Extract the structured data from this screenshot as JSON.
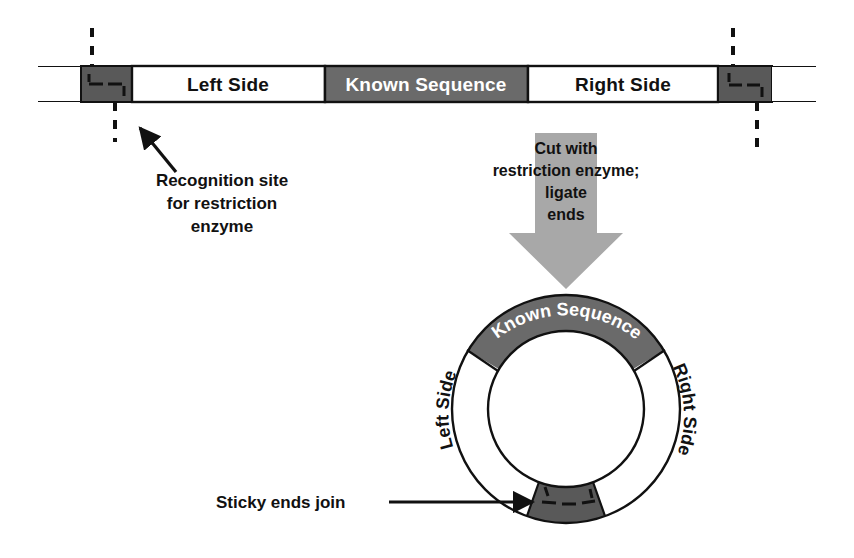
{
  "figure": {
    "colors": {
      "background": "#ffffff",
      "outline": "#111111",
      "known_sequence_gray": "#6a6a6a",
      "recognition_site_gray": "#595959",
      "arrow_gray": "#a8a8a8",
      "text_dark": "#111111",
      "text_light": "#ffffff"
    }
  },
  "linear_molecule": {
    "name": "linear-dna-bar",
    "segments": [
      {
        "id": "flank-left",
        "label": "",
        "fill": "#ffffff",
        "text_color": "dark"
      },
      {
        "id": "recognition-left",
        "label": "",
        "fill": "#595959",
        "text_color": "light"
      },
      {
        "id": "left-side",
        "label": "Left Side",
        "fill": "#ffffff",
        "text_color": "dark"
      },
      {
        "id": "known-sequence",
        "label": "Known Sequence",
        "fill": "#6a6a6a",
        "text_color": "light"
      },
      {
        "id": "right-side",
        "label": "Right Side",
        "fill": "#ffffff",
        "text_color": "dark"
      },
      {
        "id": "recognition-right",
        "label": "",
        "fill": "#595959",
        "text_color": "light"
      },
      {
        "id": "flank-right",
        "label": "",
        "fill": "#ffffff",
        "text_color": "dark"
      }
    ],
    "cut_markers": [
      {
        "id": "cut-left",
        "style": "dashed-vertical"
      },
      {
        "id": "cut-right",
        "style": "dashed-vertical"
      }
    ]
  },
  "annotations": {
    "recognition_site": {
      "lines": [
        "Recognition site",
        "for restriction",
        "enzyme"
      ],
      "pointer": "arrow"
    },
    "process_arrow": {
      "lines": [
        "Cut with",
        "restriction enzyme;",
        "ligate",
        "ends"
      ],
      "direction": "down",
      "fill": "#a8a8a8"
    },
    "sticky_ends": {
      "label": "Sticky ends join",
      "pointer": "arrow"
    }
  },
  "circular_molecule": {
    "name": "circular-dna-ring",
    "arcs": [
      {
        "id": "ring-known-sequence",
        "label": "Known Sequence",
        "fill": "#6a6a6a",
        "text_color": "light"
      },
      {
        "id": "ring-right-side",
        "label": "Right Side",
        "fill": "#ffffff",
        "text_color": "dark"
      },
      {
        "id": "ring-sticky-joint",
        "label": "",
        "fill": "#595959",
        "text_color": "light"
      },
      {
        "id": "ring-left-side",
        "label": "Left Side",
        "fill": "#ffffff",
        "text_color": "dark"
      }
    ]
  }
}
